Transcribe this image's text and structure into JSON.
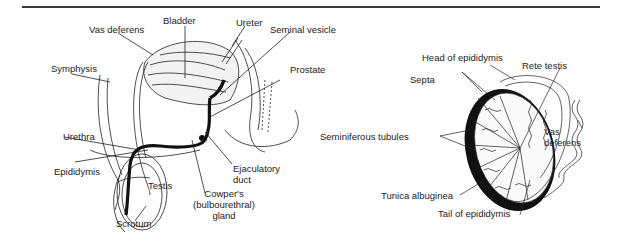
{
  "figure": {
    "left_diagram": {
      "title": "Male reproductive system (sagittal section)",
      "labels": {
        "bladder": "Bladder",
        "vas_deferens": "Vas deferens",
        "ureter": "Ureter",
        "seminal_vesicle": "Seminal vesicle",
        "symphysis": "Symphysis",
        "prostate": "Prostate",
        "urethra": "Urethra",
        "epididymis": "Epididymis",
        "testis": "Testis",
        "scrotum": "Scrotum",
        "ejaculatory_duct_1": "Ejaculatory",
        "ejaculatory_duct_2": "duct",
        "cowpers_1": "Cowper's",
        "cowpers_2": "(bulbourethral)",
        "cowpers_3": "gland"
      }
    },
    "right_diagram": {
      "title": "Testis (section)",
      "labels": {
        "head_of_epididymis": "Head of epididymis",
        "rete_testis": "Rete testis",
        "septa": "Septa",
        "seminiferous_tubules": "Seminiferous tubules",
        "vas_deferens_1": "Vas",
        "vas_deferens_2": "deferens",
        "tunica_albuginea": "Tunica albuginea",
        "tail_of_epididymis": "Tail of epididymis"
      }
    },
    "colors": {
      "ink": "#1a1a1a",
      "rule": "#3a3a3a",
      "background": "#ffffff"
    }
  }
}
